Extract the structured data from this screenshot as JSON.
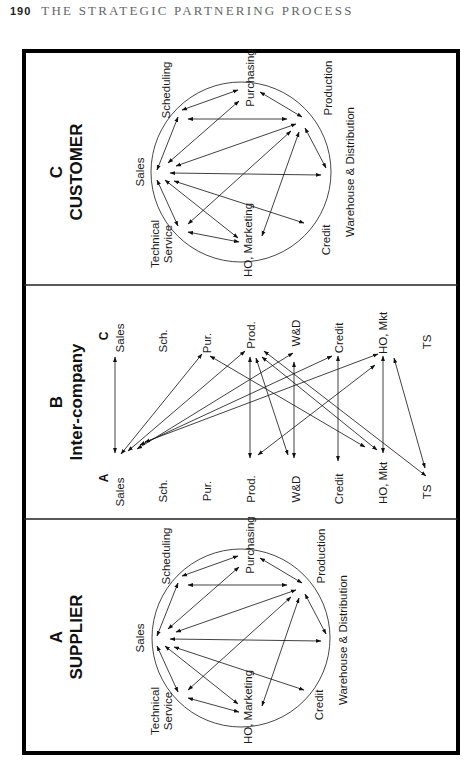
{
  "header": {
    "page_number": "190",
    "running_title": "THE STRATEGIC PARTNERING PROCESS"
  },
  "panels": {
    "supplier": {
      "letter": "A",
      "title": "SUPPLIER",
      "nodes": [
        "Sales",
        "Scheduling",
        "Purchasing",
        "Production",
        "Warehouse & Distribution",
        "Credit",
        "HO, Marketing",
        "Technical",
        "Service"
      ]
    },
    "intercompany": {
      "letter": "B",
      "title": "Inter-company",
      "left_letter": "A",
      "right_letter": "C",
      "left_nodes": [
        "Sales",
        "Sch.",
        "Pur.",
        "Prod.",
        "W&D",
        "Credit",
        "HO, Mkt",
        "TS"
      ],
      "right_nodes": [
        "Sales",
        "Sch.",
        "Pur.",
        "Prod.",
        "W&D",
        "Credit",
        "HO, Mkt",
        "TS"
      ]
    },
    "customer": {
      "letter": "C",
      "title": "CUSTOMER",
      "nodes": [
        "Sales",
        "Scheduling",
        "Purchasing",
        "Production",
        "Warehouse & Distribution",
        "Credit",
        "HO, Marketing",
        "Technical",
        "Service"
      ]
    }
  },
  "colors": {
    "ink": "#111111",
    "header_text": "#666666"
  }
}
